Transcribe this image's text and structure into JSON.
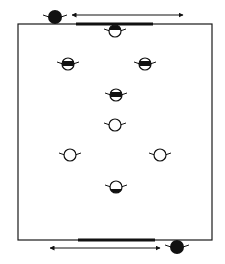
{
  "diagram": {
    "type": "soccer-drill-formation",
    "field": {
      "x": 18,
      "y": 24,
      "width": 194,
      "height": 216,
      "stroke": "#1a1a1a"
    },
    "goals": [
      {
        "id": "top-goal-line",
        "x1": 76,
        "x2": 153,
        "y": 24
      },
      {
        "id": "bottom-goal-line",
        "x1": 78,
        "x2": 155,
        "y": 240
      }
    ],
    "arrows": [
      {
        "id": "top-arrow",
        "x1": 72,
        "x2": 183,
        "y": 15,
        "double": true
      },
      {
        "id": "bottom-arrow",
        "x1": 50,
        "x2": 160,
        "y": 248,
        "double": true
      }
    ],
    "players": [
      {
        "id": "top-outside-player",
        "style": "solid",
        "cx": 55,
        "cy": 17
      },
      {
        "id": "top-goalkeeper",
        "style": "top-half",
        "cx": 115,
        "cy": 31
      },
      {
        "id": "left-striped-player",
        "style": "band",
        "cx": 68,
        "cy": 64
      },
      {
        "id": "right-striped-player",
        "style": "band",
        "cx": 145,
        "cy": 64
      },
      {
        "id": "center-striped-player",
        "style": "band",
        "cx": 116,
        "cy": 95
      },
      {
        "id": "center-open-player",
        "style": "open",
        "cx": 115,
        "cy": 125
      },
      {
        "id": "left-open-player",
        "style": "open",
        "cx": 70,
        "cy": 155
      },
      {
        "id": "right-open-player",
        "style": "open",
        "cx": 160,
        "cy": 155
      },
      {
        "id": "bottom-goalkeeper",
        "style": "bottom-half",
        "cx": 116,
        "cy": 187
      },
      {
        "id": "bottom-outside-player",
        "style": "solid",
        "cx": 177,
        "cy": 247
      }
    ],
    "colors": {
      "ink": "#111111",
      "paper": "#ffffff"
    }
  }
}
